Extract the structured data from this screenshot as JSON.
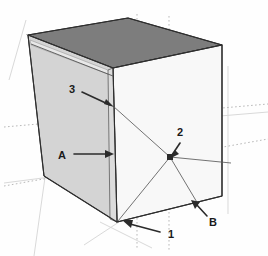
{
  "figure": {
    "background_color": "#fefefe",
    "colors": {
      "top_face": "#7d7d7d",
      "left_face": "#d4d4d4",
      "front_face": "#f8f8f8",
      "inner_sliver": "#e6e6e6",
      "edge_stroke": "#2e2e2e",
      "leader_stroke": "#2b2b2b",
      "guide_dotted": "#b9b9b9",
      "guide_faint": "#d9d9d9",
      "label_text": "#1a1a1a"
    },
    "labels": [
      {
        "id": "label-3",
        "text": "3",
        "x": 72,
        "y": 93
      },
      {
        "id": "label-A",
        "text": "A",
        "x": 62,
        "y": 156
      },
      {
        "id": "label-2",
        "text": "2",
        "x": 178,
        "y": 133
      },
      {
        "id": "label-1",
        "text": "1",
        "x": 171,
        "y": 234
      },
      {
        "id": "label-B",
        "text": "B",
        "x": 212,
        "y": 223
      }
    ],
    "geometry": {
      "top_back": [
        128,
        18
      ],
      "top_left": [
        28,
        35
      ],
      "top_front": [
        113,
        68
      ],
      "top_right": [
        222,
        45
      ],
      "bottom_left": [
        44,
        176
      ],
      "bottom_front": [
        117,
        222
      ],
      "bottom_right": [
        222,
        196
      ]
    },
    "callout_targets": {
      "3": [
        113,
        106
      ],
      "A": [
        113,
        154
      ],
      "2": [
        170,
        157
      ],
      "1": [
        119,
        221
      ],
      "B": [
        200,
        204
      ]
    }
  }
}
